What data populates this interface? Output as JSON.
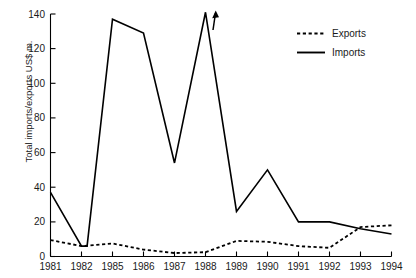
{
  "chart_data": {
    "type": "line",
    "title": "",
    "xlabel": "",
    "ylabel": "Total imports/exports US$ m.",
    "ylim": [
      0,
      140
    ],
    "yticks": [
      0,
      20,
      40,
      60,
      80,
      100,
      120,
      140
    ],
    "grid": false,
    "legend_position": "top-right",
    "categories": [
      "1981",
      "1982",
      "1985",
      "1986",
      "1987",
      "1988",
      "1989",
      "1990",
      "1991",
      "1992",
      "1993",
      "1994"
    ],
    "series": [
      {
        "name": "Exports",
        "style": "dotted",
        "color": "#000000",
        "values": [
          9.5,
          6,
          7.5,
          4,
          2,
          2.5,
          9,
          8.5,
          6,
          5,
          17,
          18
        ]
      },
      {
        "name": "Imports",
        "style": "solid",
        "color": "#000000",
        "values": [
          37,
          6,
          137,
          129,
          54,
          141,
          26,
          50,
          20,
          20,
          16,
          13
        ]
      }
    ],
    "annotations": [
      {
        "name": "off-scale-arrow",
        "text": "",
        "icon": "up-arrow-icon",
        "near_category": "1988",
        "note": "Imports value at 1988 continues above the plotted axis maximum"
      }
    ],
    "extra_vertices": {
      "note": "Imports line has an unlabeled vertex between 1982 and 1985 rising toward the 1985 peak"
    }
  },
  "legend": {
    "items": [
      {
        "label": "Exports",
        "swatch": "dotted-line-swatch"
      },
      {
        "label": "Imports",
        "swatch": "solid-line-swatch"
      }
    ]
  },
  "axes": {
    "y_tick_labels": [
      "0",
      "20",
      "40",
      "60",
      "80",
      "100",
      "120",
      "140"
    ],
    "x_tick_labels": [
      "1981",
      "1982",
      "1985",
      "1986",
      "1987",
      "1988",
      "1989",
      "1990",
      "1991",
      "1992",
      "1993",
      "1994"
    ],
    "y_axis_title": "Total imports/exports US$ m."
  }
}
